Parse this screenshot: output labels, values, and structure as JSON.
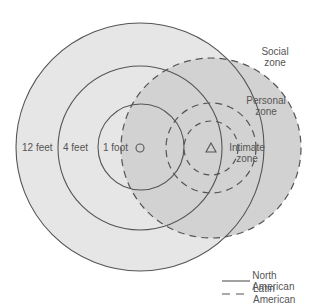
{
  "diagram": {
    "labels": {
      "twelve_feet": "12 feet",
      "four_feet": "4 feet",
      "one_foot": "1 foot",
      "social_zone_line1": "Social",
      "social_zone_line2": "zone",
      "personal_zone_line1": "Personal",
      "personal_zone_line2": "zone",
      "intimate_zone_line1": "Intimate",
      "intimate_zone_line2": "zone"
    },
    "legend": [
      {
        "label": "North American",
        "style": "solid"
      },
      {
        "label": "Latin American",
        "style": "dashed"
      }
    ],
    "colors": {
      "outer_fill": "#e6e6e6",
      "overlap_fill": "#d2d2d2",
      "stroke": "#555555"
    },
    "markers": {
      "north_american": "circle",
      "latin_american": "triangle"
    }
  }
}
